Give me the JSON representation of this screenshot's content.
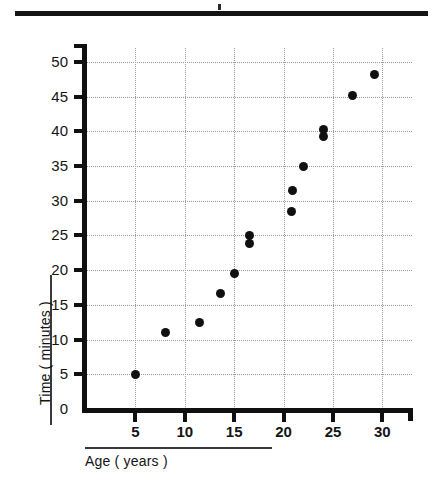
{
  "chart_data": {
    "type": "scatter",
    "title": "",
    "xlabel": "Age ( years )",
    "ylabel": "Time ( minutes )",
    "xlim": [
      0,
      33
    ],
    "ylim": [
      0,
      52
    ],
    "xticks": [
      5,
      10,
      15,
      20,
      25,
      30
    ],
    "yticks": [
      0,
      5,
      10,
      15,
      20,
      25,
      30,
      35,
      40,
      45,
      50
    ],
    "grid": true,
    "legend": false,
    "marker_color": "#101010",
    "points": [
      {
        "x": 5.0,
        "y": 5.0
      },
      {
        "x": 8.0,
        "y": 11.0
      },
      {
        "x": 11.5,
        "y": 12.5
      },
      {
        "x": 13.6,
        "y": 16.7
      },
      {
        "x": 15.0,
        "y": 19.5
      },
      {
        "x": 16.6,
        "y": 25.0
      },
      {
        "x": 16.6,
        "y": 23.8
      },
      {
        "x": 20.8,
        "y": 28.5
      },
      {
        "x": 20.9,
        "y": 31.5
      },
      {
        "x": 22.0,
        "y": 35.0
      },
      {
        "x": 24.0,
        "y": 39.3
      },
      {
        "x": 24.0,
        "y": 40.3
      },
      {
        "x": 27.0,
        "y": 45.2
      },
      {
        "x": 29.2,
        "y": 48.2
      }
    ]
  },
  "axes": {
    "x_tick_labels": [
      "5",
      "10",
      "15",
      "20",
      "25",
      "30"
    ],
    "y_tick_labels": [
      "0",
      "5",
      "10",
      "15",
      "20",
      "25",
      "30",
      "35",
      "40",
      "45",
      "50"
    ]
  },
  "decor": {
    "top_rule_color": "#141414",
    "axis_color": "#101010",
    "grid_color": "#9a9a9a"
  }
}
